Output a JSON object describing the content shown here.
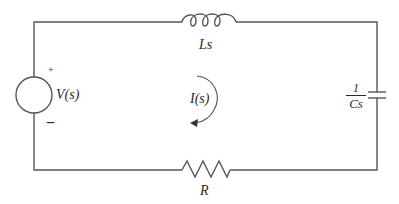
{
  "diagram": {
    "type": "series RLC circuit (s-domain)",
    "colors": {
      "wire": "#555555",
      "text": "#2a2a2a",
      "background": "#ffffff"
    },
    "components": {
      "source": {
        "label": "V(s)",
        "plus": "+",
        "minus": "−"
      },
      "inductor": {
        "label": "Ls"
      },
      "capacitor": {
        "label_numerator": "1",
        "label_denominator": "Cs"
      },
      "resistor": {
        "label": "R"
      },
      "current": {
        "label": "I(s)",
        "direction": "counterclockwise-arrow"
      }
    }
  }
}
